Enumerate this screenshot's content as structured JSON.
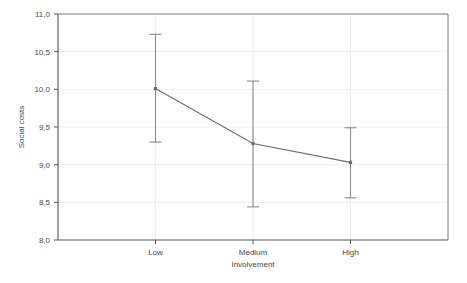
{
  "chart_data": {
    "type": "line",
    "title": "",
    "xlabel": "Involvement",
    "ylabel": "Social costs",
    "categories": [
      "Low",
      "Medium",
      "High"
    ],
    "values": [
      10.01,
      9.28,
      9.03
    ],
    "error_low": [
      9.3,
      8.44,
      8.56
    ],
    "error_high": [
      10.73,
      10.11,
      9.49
    ],
    "series": [
      {
        "name": "Social costs",
        "values": [
          10.01,
          9.28,
          9.03
        ]
      }
    ],
    "ylim": [
      8.0,
      11.0
    ],
    "ytick_values": [
      8.0,
      8.5,
      9.0,
      9.5,
      10.0,
      10.5,
      11.0
    ],
    "ytick_labels": [
      "8,0",
      "8,5",
      "9,0",
      "9,5",
      "10,0",
      "10,5",
      "11,0"
    ],
    "grid": true,
    "legend": "none",
    "error_bar_style": "capped-whisker",
    "decimal_separator": ","
  },
  "style": {
    "line_color": "#6e6e6e",
    "error_color": "#8a8a8a",
    "grid_color": "#ededed",
    "axis_color": "#555555",
    "frame_color": "#777777",
    "background": "#ffffff",
    "text_color": "#4a4a4a"
  }
}
